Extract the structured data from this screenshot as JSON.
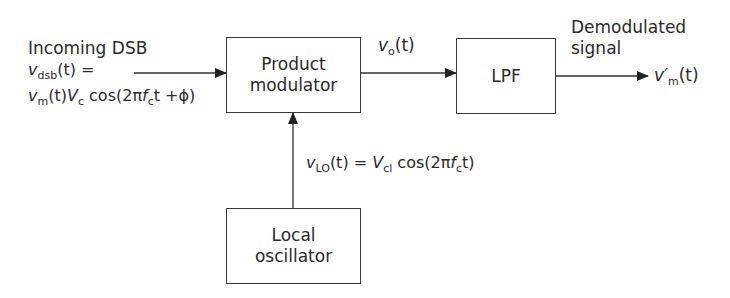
{
  "diagram": {
    "type": "block-diagram",
    "blocks": [
      {
        "id": "product_modulator",
        "line1": "Product",
        "line2": "modulator"
      },
      {
        "id": "lpf",
        "label": "LPF"
      },
      {
        "id": "local_oscillator",
        "line1": "Local",
        "line2": "oscillator"
      }
    ],
    "input": {
      "caption": "Incoming DSB",
      "eq_line1": {
        "v": "v",
        "sub": "dsb",
        "rest": "(t) ="
      },
      "eq_line2": {
        "v": "v",
        "vsub": "m",
        "t": "(t)",
        "V": "V",
        "Vsub": "c",
        "cos": " cos(2π",
        "f": "f",
        "fsub": "c",
        "tail": "t +ϕ)"
      }
    },
    "intermediate": {
      "v": "v",
      "sub": "o",
      "rest": "(t)"
    },
    "lo_signal": {
      "v": "v",
      "sub": "LO",
      "t": "(t) = ",
      "V": "V",
      "Vsub": "cl",
      "cos": " cos(2π",
      "f": "f",
      "fsub": "c",
      "tail": "t)"
    },
    "output": {
      "caption_line1": "Demodulated",
      "caption_line2": "signal",
      "v": "v′",
      "sub": "m",
      "rest": "(t)"
    },
    "connections": [
      {
        "from": "input",
        "to": "product_modulator"
      },
      {
        "from": "product_modulator",
        "to": "lpf",
        "label": "vo(t)"
      },
      {
        "from": "lpf",
        "to": "output",
        "label": "v'm(t)"
      },
      {
        "from": "local_oscillator",
        "to": "product_modulator",
        "label": "vLO(t) = Vcl cos(2πfct)"
      }
    ],
    "colors": {
      "line": "#2a2a2a",
      "text": "#2a2a2a",
      "background": "#ffffff"
    }
  }
}
